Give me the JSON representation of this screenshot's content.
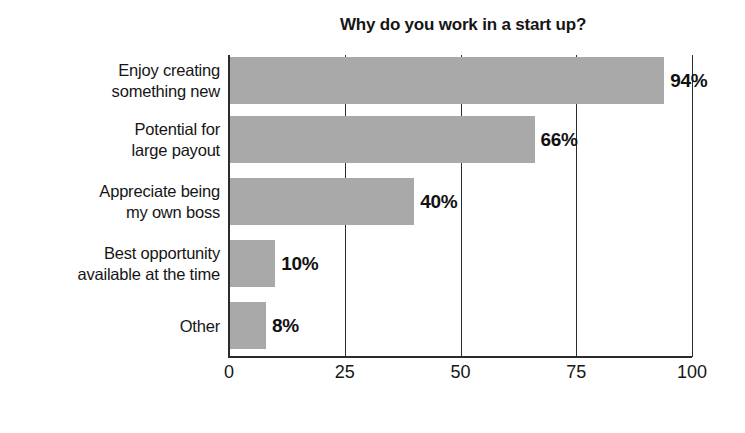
{
  "chart_data": {
    "type": "bar",
    "orientation": "horizontal",
    "title": "Why do you work in a start up?",
    "xlabel": "",
    "ylabel": "",
    "xlim": [
      0,
      100
    ],
    "xticks": [
      "0",
      "25",
      "50",
      "75",
      "100"
    ],
    "xtick_values": [
      0,
      25,
      50,
      75,
      100
    ],
    "grid": "vertical",
    "legend": "none",
    "bar_color": "#a9a9a9",
    "axis_color": "#2b2b2b",
    "categories": [
      "Enjoy creating something new",
      "Potential for large payout",
      "Appreciate being my own boss",
      "Best opportunity available at the time",
      "Other"
    ],
    "category_lines": [
      [
        "Enjoy creating",
        "something new"
      ],
      [
        "Potential for",
        "large payout"
      ],
      [
        "Appreciate being",
        "my own boss"
      ],
      [
        "Best opportunity",
        "available at the time"
      ],
      [
        "Other"
      ]
    ],
    "values": [
      94,
      66,
      40,
      10,
      8
    ],
    "value_labels": [
      "94%",
      "66%",
      "40%",
      "10%",
      "8%"
    ]
  }
}
